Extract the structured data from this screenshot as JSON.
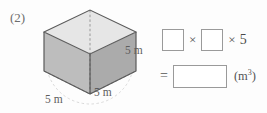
{
  "problem": {
    "number": "(2)"
  },
  "figure": {
    "shape_name": "cube",
    "labels": {
      "height": "5 m",
      "depth": "5 m",
      "width": "5 m"
    },
    "colors": {
      "top_face": "#e3e3e3",
      "left_face": "#b9b9b9",
      "right_face": "#a9a9a9",
      "floor_face": "#c6c6c6",
      "edge": "#5a5a5a",
      "hidden_edge": "#8d8d8d",
      "guide_arc": "#c9c9c9"
    }
  },
  "equation": {
    "product_row": {
      "box1_value": "",
      "times1": "×",
      "box2_value": "",
      "times2": "×",
      "factor": "5"
    },
    "result_row": {
      "equals": "=",
      "answer_value": "",
      "unit_base": "(m",
      "unit_exponent": "3",
      "unit_close": ")"
    }
  }
}
